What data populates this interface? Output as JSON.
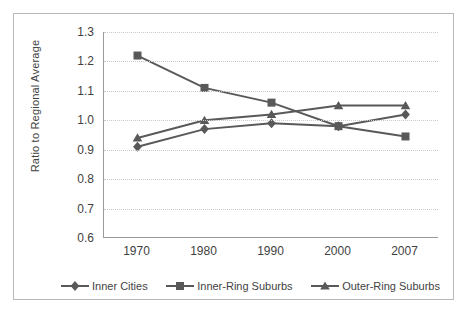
{
  "chart_data": {
    "type": "line",
    "title": "",
    "xlabel": "",
    "ylabel": "Ratio to Regional Average",
    "categories": [
      "1970",
      "1980",
      "1990",
      "2000",
      "2007"
    ],
    "ylim": [
      0.6,
      1.3
    ],
    "ytick_labels": [
      "0.6",
      "0.7",
      "0.8",
      "0.9",
      "1.0",
      "1.1",
      "1.2",
      "1.3"
    ],
    "ytick_values": [
      0.6,
      0.7,
      0.8,
      0.9,
      1.0,
      1.1,
      1.2,
      1.3
    ],
    "grid": "horizontal-dotted",
    "legend_position": "bottom",
    "series": [
      {
        "name": "Inner Cities",
        "marker": "diamond",
        "color": "#595959",
        "values": [
          0.91,
          0.97,
          0.99,
          0.98,
          1.02
        ]
      },
      {
        "name": "Inner-Ring Suburbs",
        "marker": "square",
        "color": "#595959",
        "values": [
          1.22,
          1.11,
          1.06,
          0.98,
          0.945
        ]
      },
      {
        "name": "Outer-Ring Suburbs",
        "marker": "triangle",
        "color": "#595959",
        "values": [
          0.94,
          1.0,
          1.02,
          1.05,
          1.05
        ]
      }
    ]
  },
  "axis": {
    "y_title": "Ratio to Regional Average"
  },
  "legend": {
    "items": [
      {
        "label": "Inner Cities",
        "marker": "diamond-marker"
      },
      {
        "label": "Inner-Ring Suburbs",
        "marker": "square-marker"
      },
      {
        "label": "Outer-Ring Suburbs",
        "marker": "triangle-marker"
      }
    ]
  },
  "colors": {
    "series": "#595959",
    "axis": "#9a9a9a",
    "grid": "#c9c9c9",
    "frame": "#b8b8b8",
    "text": "#3f3f3f"
  }
}
